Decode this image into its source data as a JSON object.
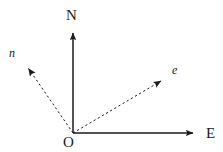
{
  "figure": {
    "type": "vector-diagram",
    "background_color": "#ffffff",
    "stroke_color": "#1a1a1a",
    "width": 223,
    "height": 152,
    "origin": {
      "x": 73,
      "y": 133,
      "label": "O"
    },
    "axes": [
      {
        "name": "north-axis",
        "label": "N",
        "style": "solid",
        "arrow": "filled-triangle",
        "from": {
          "x": 73,
          "y": 133
        },
        "to": {
          "x": 73,
          "y": 28
        }
      },
      {
        "name": "east-axis",
        "label": "E",
        "style": "solid",
        "arrow": "filled-triangle",
        "from": {
          "x": 73,
          "y": 133
        },
        "to": {
          "x": 199,
          "y": 133
        }
      }
    ],
    "vectors": [
      {
        "name": "n-vector",
        "label": "n",
        "style": "dashed",
        "arrow": "filled-triangle",
        "from": {
          "x": 73,
          "y": 133
        },
        "to": {
          "x": 24,
          "y": 62
        }
      },
      {
        "name": "e-vector",
        "label": "e",
        "style": "dashed",
        "arrow": "filled-triangle",
        "from": {
          "x": 73,
          "y": 133
        },
        "to": {
          "x": 167,
          "y": 77
        }
      }
    ]
  }
}
